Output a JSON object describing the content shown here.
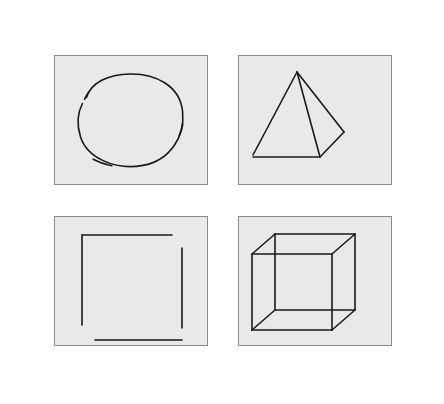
{
  "figure": {
    "background_color": "#ffffff",
    "panel_background_color": "#e9e9e9",
    "panel_border_color": "#8a8a8a",
    "stroke_color": "#1a1a1a",
    "layout": {
      "rows": 2,
      "columns": 2,
      "panel_width": 154,
      "panel_height": 130,
      "column_gap": 30,
      "row_gap": 31,
      "origin_x": 54,
      "origin_y": 55
    },
    "panels": [
      {
        "id": "panel-circle",
        "position": "top-left",
        "shape_name": "circle",
        "shape_label": "Circle",
        "style": "hand-drawn open circle with gap at upper-left and overlapping stroke tails",
        "geometry": {
          "center_x": 76,
          "center_y": 64,
          "radius_x": 52,
          "radius_y": 46,
          "gap_degrees": 22
        }
      },
      {
        "id": "panel-pyramid",
        "position": "top-right",
        "shape_name": "pyramid",
        "shape_label": "Pyramid",
        "style": "wireframe square pyramid seen in three-quarter view",
        "geometry": {
          "apex": [
            58,
            16
          ],
          "front_left": [
            14,
            99
          ],
          "front_right": [
            81,
            101
          ],
          "right_vertex": [
            105,
            76
          ]
        }
      },
      {
        "id": "panel-square",
        "position": "bottom-left",
        "shape_name": "square",
        "shape_label": "Square",
        "style": "hand-drawn square with open corners, four disconnected strokes",
        "geometry": {
          "top": [
            [
              27,
              18
            ],
            [
              117,
              18
            ]
          ],
          "right": [
            [
              127,
              31
            ],
            [
              127,
              111
            ]
          ],
          "bottom": [
            [
              40,
              123
            ],
            [
              127,
              123
            ]
          ],
          "left": [
            [
              27,
              18
            ],
            [
              27,
              108
            ]
          ]
        }
      },
      {
        "id": "panel-cube",
        "position": "bottom-right",
        "shape_name": "cube",
        "shape_label": "Cube",
        "style": "transparent wireframe cube (Necker cube) with all twelve edges drawn",
        "geometry": {
          "front_face": [
            [
              13,
              37
            ],
            [
              93,
              37
            ],
            [
              93,
              113
            ],
            [
              13,
              113
            ]
          ],
          "depth_offset_x": 23,
          "depth_offset_y": -20
        }
      }
    ]
  }
}
